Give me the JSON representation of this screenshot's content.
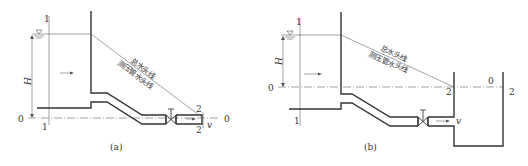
{
  "panel_a": {
    "caption": "(a)",
    "section_1_top": "1",
    "section_1_bottom": "1",
    "section_2_top": "2",
    "section_2_bottom": "2",
    "datum_left": "0",
    "datum_right": "0",
    "head_label": "H",
    "velocity_label": "v",
    "total_head_line": "总水头线",
    "piezometric_line": "测压管水头线"
  },
  "panel_b": {
    "caption": "(b)",
    "section_1_top": "1",
    "section_1_bottom": "1",
    "section_2_left": "2",
    "section_2_right": "2",
    "datum_left": "0",
    "datum_right": "0",
    "head_label": "H",
    "velocity_label": "v",
    "total_head_line": "总水头线",
    "piezometric_line": "测压管水头线"
  }
}
